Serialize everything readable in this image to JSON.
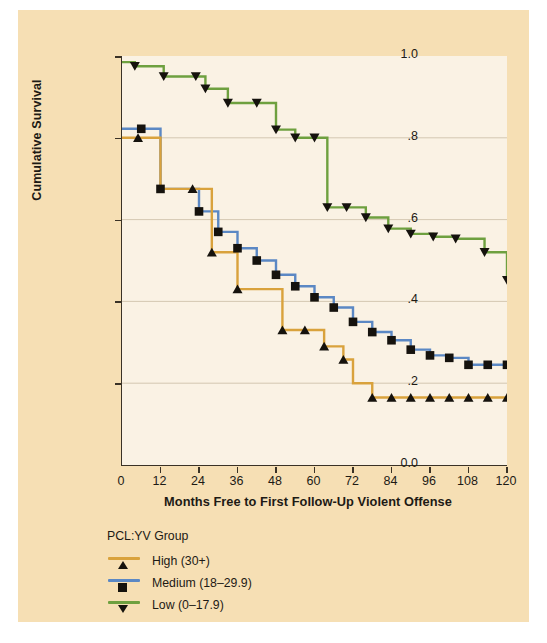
{
  "figure": {
    "background_color": "#f6dfb4",
    "plot_background_color": "#faf2e4",
    "axis_color": "#3a3226",
    "gridline_color": "#c9bda4"
  },
  "axes": {
    "ylabel": "Cumulative Survival",
    "xlabel": "Months Free to First Follow-Up Violent Offense",
    "yticks": [
      "0.0",
      ".2",
      ".4",
      ".6",
      ".8",
      "1.0"
    ],
    "ytick_values": [
      0.0,
      0.2,
      0.4,
      0.6,
      0.8,
      1.0
    ],
    "xticks": [
      "0",
      "12",
      "24",
      "36",
      "48",
      "60",
      "72",
      "84",
      "96",
      "108",
      "120"
    ],
    "xtick_values": [
      0,
      12,
      24,
      36,
      48,
      60,
      72,
      84,
      96,
      108,
      120
    ]
  },
  "legend": {
    "title": "PCL:YV Group",
    "entries": [
      {
        "label": "High (30+)",
        "color": "#d9a23c",
        "marker": "triangle-up"
      },
      {
        "label": "Medium (18–29.9)",
        "color": "#5b88c4",
        "marker": "square"
      },
      {
        "label": "Low (0–17.9)",
        "color": "#6ea03f",
        "marker": "triangle-down"
      }
    ]
  },
  "chart_data": {
    "type": "line",
    "subtype": "kaplan-meier-step",
    "title": "",
    "xlabel": "Months Free to First Follow-Up Violent Offense",
    "ylabel": "Cumulative Survival",
    "xlim": [
      0,
      120
    ],
    "ylim": [
      0.0,
      1.0
    ],
    "grid": "horizontal",
    "legend_position": "below-axes-left",
    "series": [
      {
        "name": "Low (0–17.9)",
        "color": "#6ea03f",
        "marker": "triangle-down",
        "x": [
          0,
          4,
          13,
          23,
          26,
          33,
          42,
          48,
          54,
          60,
          64,
          70,
          76,
          83,
          90,
          97,
          104,
          113,
          120
        ],
        "y": [
          0.985,
          0.975,
          0.95,
          0.95,
          0.92,
          0.885,
          0.885,
          0.82,
          0.8,
          0.8,
          0.63,
          0.63,
          0.605,
          0.578,
          0.565,
          0.558,
          0.553,
          0.52,
          0.452
        ],
        "censored_x": [
          4,
          13,
          23,
          26,
          33,
          42,
          48,
          54,
          60,
          64,
          70,
          76,
          83,
          90,
          97,
          104,
          113,
          120
        ]
      },
      {
        "name": "Medium (18–29.9)",
        "color": "#5b88c4",
        "marker": "square",
        "x": [
          0,
          6,
          12,
          18,
          24,
          30,
          36,
          42,
          48,
          54,
          60,
          66,
          72,
          78,
          84,
          90,
          96,
          102,
          108,
          114,
          120
        ],
        "y": [
          0.822,
          0.822,
          0.675,
          0.675,
          0.62,
          0.57,
          0.53,
          0.5,
          0.465,
          0.437,
          0.41,
          0.385,
          0.35,
          0.325,
          0.305,
          0.282,
          0.268,
          0.262,
          0.245,
          0.245,
          0.245
        ],
        "censored_x": [
          6,
          12,
          24,
          30,
          36,
          42,
          48,
          54,
          60,
          66,
          72,
          78,
          84,
          90,
          96,
          102,
          108,
          114,
          120
        ]
      },
      {
        "name": "High (30+)",
        "color": "#d9a23c",
        "marker": "triangle-up",
        "x": [
          0,
          5,
          12,
          22,
          28,
          36,
          42,
          50,
          57,
          63,
          69,
          72,
          78,
          84,
          90,
          96,
          102,
          108,
          114,
          120
        ],
        "y": [
          0.8,
          0.8,
          0.675,
          0.675,
          0.52,
          0.43,
          0.43,
          0.33,
          0.33,
          0.29,
          0.258,
          0.2,
          0.165,
          0.165,
          0.165,
          0.165,
          0.165,
          0.165,
          0.165,
          0.165
        ],
        "censored_x": [
          5,
          22,
          28,
          36,
          50,
          57,
          63,
          69,
          78,
          84,
          90,
          96,
          102,
          108,
          114,
          120
        ]
      }
    ]
  }
}
